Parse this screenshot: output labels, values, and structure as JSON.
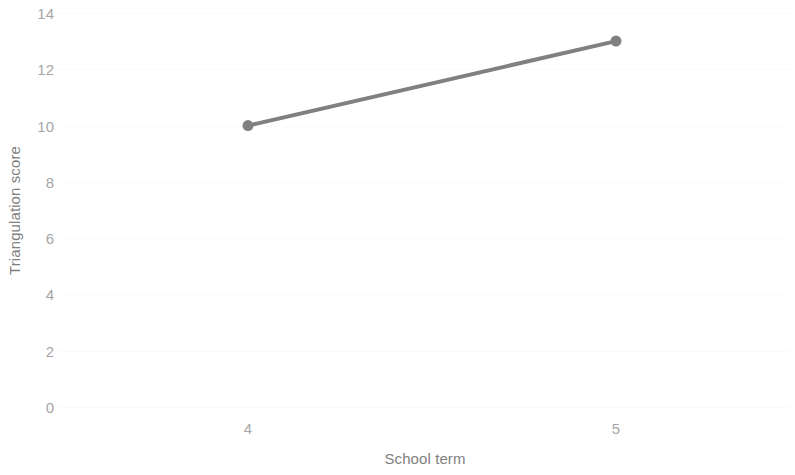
{
  "chart_data": {
    "type": "line",
    "title": "",
    "subtitle": "",
    "xlabel": "School term",
    "ylabel": "Triangulation score",
    "x": [
      4,
      5
    ],
    "xtick_labels": [
      "4",
      "5"
    ],
    "ytick_labels": [
      "0",
      "2",
      "4",
      "6",
      "8",
      "10",
      "12",
      "14"
    ],
    "yticks": [
      0,
      2,
      4,
      6,
      8,
      10,
      12,
      14
    ],
    "xlim": [
      3.5,
      5.5
    ],
    "ylim": [
      0,
      14
    ],
    "grid": true,
    "grid_axis": "y",
    "legend": false,
    "legend_position": "none",
    "series": [
      {
        "name": "Triangulation score",
        "values": [
          10,
          13
        ],
        "color": "#808080",
        "marker": "circle",
        "line_width": 4
      }
    ],
    "annotations": []
  },
  "style": {
    "background": "#ffffff",
    "tick_label_color": "#a6a6a6",
    "axis_title_color": "#7f7f7f",
    "gridline_color": "#f4f4f4",
    "series_color": "#808080"
  }
}
